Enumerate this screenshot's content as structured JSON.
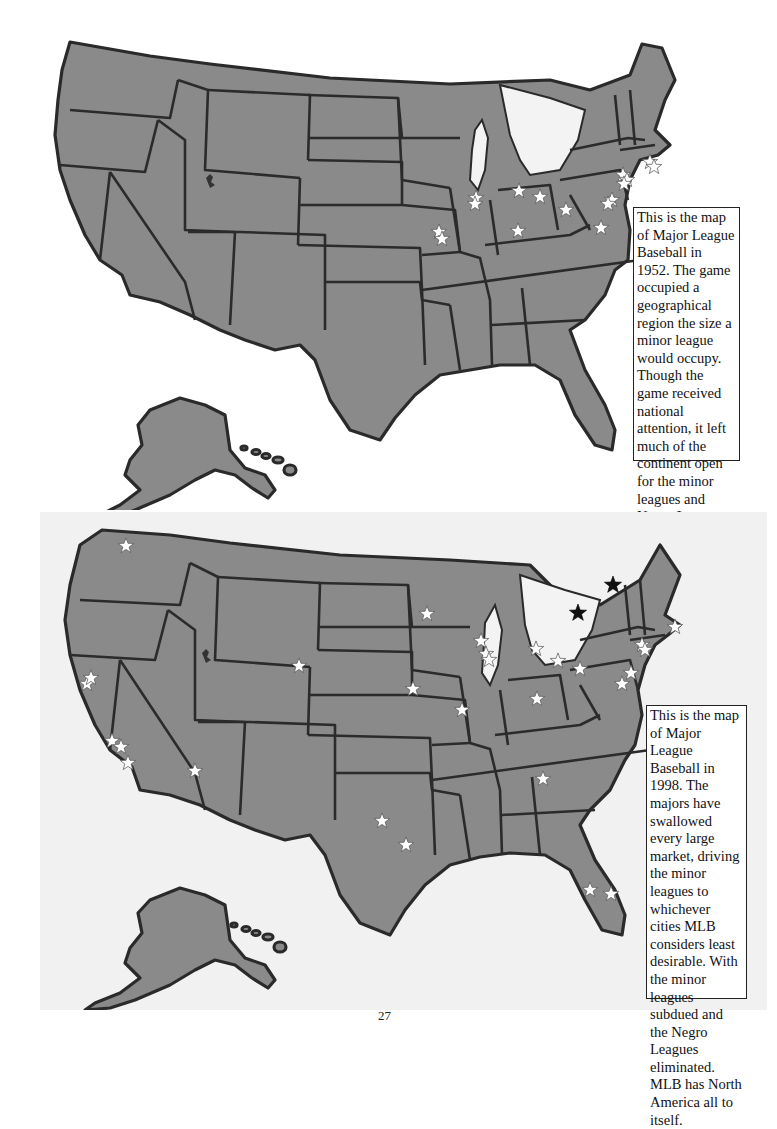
{
  "page": {
    "page_number": "27"
  },
  "maps": [
    {
      "id": "mlb-1952",
      "year": "1952",
      "caption": "This is the map of Major League Baseball in 1952. The game occupied a geographical region the size a minor league would occupy. Though the game received national attention, it left much of the continent open for the minor leagues and Negro Leagues to prosper.",
      "caption_lines": [
        "This is the map of",
        "Major League",
        "Baseball in 1952.",
        "The game occu-",
        "pied a geographi-",
        "cal region the size",
        "a minor league",
        "would occupy.",
        "Though the game",
        "received national",
        "attention, it left",
        "much of the conti-",
        "nent open for the",
        "minor leagues",
        "and Negro",
        "Leagues to pros-",
        "per."
      ],
      "marker_legend": {
        "white-star": "Major League team city"
      },
      "markers": [
        {
          "region": "Boston",
          "type": "white-star"
        },
        {
          "region": "Boston",
          "type": "white-star"
        },
        {
          "region": "New York",
          "type": "white-star"
        },
        {
          "region": "New York",
          "type": "white-star"
        },
        {
          "region": "New York",
          "type": "white-star"
        },
        {
          "region": "Philadelphia",
          "type": "white-star"
        },
        {
          "region": "Philadelphia",
          "type": "white-star"
        },
        {
          "region": "Washington",
          "type": "white-star"
        },
        {
          "region": "Pittsburgh",
          "type": "white-star"
        },
        {
          "region": "Cleveland",
          "type": "white-star"
        },
        {
          "region": "Detroit",
          "type": "white-star"
        },
        {
          "region": "Cincinnati",
          "type": "white-star"
        },
        {
          "region": "Chicago",
          "type": "white-star"
        },
        {
          "region": "Chicago",
          "type": "white-star"
        },
        {
          "region": "St. Louis",
          "type": "white-star"
        },
        {
          "region": "St. Louis",
          "type": "white-star"
        }
      ]
    },
    {
      "id": "mlb-1998",
      "year": "1998",
      "caption": "This is the map of Major League Baseball in 1998. The majors have swallowed every large market, driving the minor leagues to whichever cities MLB considers least desirable. With the minor leagues subdued and the Negro Leagues eliminated. MLB has North America all to itself.",
      "caption_lines": [
        "This is the map",
        "of Major League",
        "Baseball in 1998.",
        "The majors have",
        "swallowed",
        "every large mar-",
        "ket, driving the",
        "minor leagues",
        "to whichever",
        "cities MLB con-",
        "siders least",
        "desirable. With",
        "the minor",
        "leagues sub-",
        "dued and the",
        "Negro Leagues",
        "eliminated.",
        "MLB has North",
        "America all to",
        "itself."
      ],
      "marker_legend": {
        "white-star": "Major League team city (US)",
        "black-star": "Major League team city (Canada)"
      },
      "markers": [
        {
          "region": "Seattle",
          "type": "white-star"
        },
        {
          "region": "San Francisco",
          "type": "white-star"
        },
        {
          "region": "Oakland",
          "type": "white-star"
        },
        {
          "region": "Los Angeles",
          "type": "white-star"
        },
        {
          "region": "Anaheim",
          "type": "white-star"
        },
        {
          "region": "San Diego",
          "type": "white-star"
        },
        {
          "region": "Phoenix",
          "type": "white-star"
        },
        {
          "region": "Denver",
          "type": "white-star"
        },
        {
          "region": "Kansas City",
          "type": "white-star"
        },
        {
          "region": "Dallas",
          "type": "white-star"
        },
        {
          "region": "Houston",
          "type": "white-star"
        },
        {
          "region": "Minneapolis",
          "type": "white-star"
        },
        {
          "region": "Milwaukee",
          "type": "white-star"
        },
        {
          "region": "Chicago",
          "type": "white-star"
        },
        {
          "region": "Chicago",
          "type": "white-star"
        },
        {
          "region": "St. Louis",
          "type": "white-star"
        },
        {
          "region": "Detroit",
          "type": "white-star"
        },
        {
          "region": "Cleveland",
          "type": "white-star"
        },
        {
          "region": "Cincinnati",
          "type": "white-star"
        },
        {
          "region": "Pittsburgh",
          "type": "white-star"
        },
        {
          "region": "Atlanta",
          "type": "white-star"
        },
        {
          "region": "Tampa",
          "type": "white-star"
        },
        {
          "region": "Miami",
          "type": "white-star"
        },
        {
          "region": "Philadelphia",
          "type": "white-star"
        },
        {
          "region": "Baltimore",
          "type": "white-star"
        },
        {
          "region": "New York",
          "type": "white-star"
        },
        {
          "region": "New York",
          "type": "white-star"
        },
        {
          "region": "Boston",
          "type": "white-star"
        },
        {
          "region": "Toronto",
          "type": "black-star"
        },
        {
          "region": "Montreal",
          "type": "black-star"
        }
      ]
    }
  ],
  "colors": {
    "land": "#8a8a8a",
    "border": "#2b2b2b",
    "water": "#ffffff",
    "bottom_panel": "#f1f1f1",
    "star_us": "#ffffff",
    "star_canada": "#111111"
  }
}
